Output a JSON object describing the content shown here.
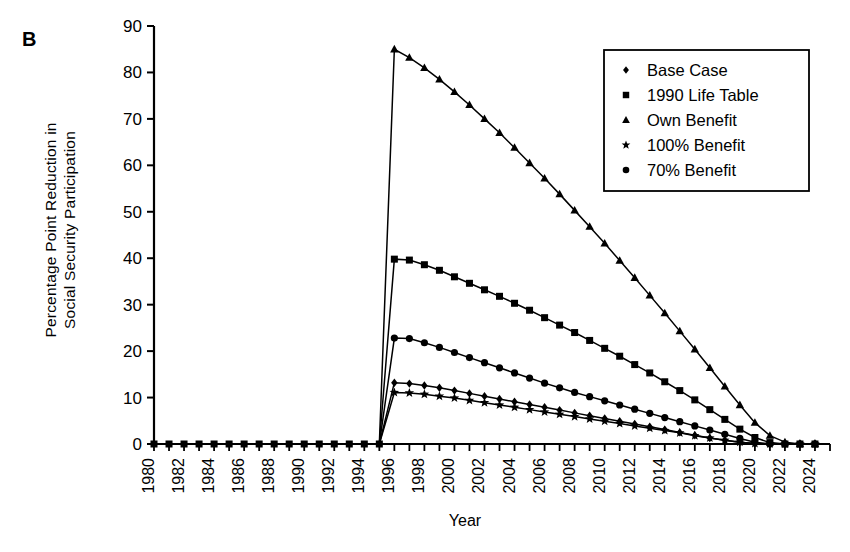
{
  "panel": {
    "label": "B"
  },
  "axes": {
    "ylabel_line1": "Percentage Point Reduction in",
    "ylabel_line2": "Social Security Participation",
    "xlabel": "Year",
    "y_ticks": [
      "0",
      "10",
      "20",
      "30",
      "40",
      "50",
      "60",
      "70",
      "80",
      "90"
    ],
    "x_ticks": [
      "1980",
      "1982",
      "1984",
      "1986",
      "1988",
      "1990",
      "1992",
      "1994",
      "1996",
      "1998",
      "2000",
      "2002",
      "2004",
      "2006",
      "2008",
      "2010",
      "2012",
      "2014",
      "2016",
      "2018",
      "2020",
      "2022",
      "2024"
    ]
  },
  "legend": {
    "items": [
      {
        "label": "Base Case",
        "marker": "diamond"
      },
      {
        "label": "1990 Life Table",
        "marker": "square"
      },
      {
        "label": "Own Benefit",
        "marker": "triangle"
      },
      {
        "label": "100% Benefit",
        "marker": "star"
      },
      {
        "label": "70% Benefit",
        "marker": "circle"
      }
    ]
  },
  "chart_data": {
    "type": "line",
    "title": "B",
    "xlabel": "Year",
    "ylabel": "Percentage Point Reduction in Social Security Participation",
    "xlim": [
      1980,
      2025
    ],
    "ylim": [
      0,
      90
    ],
    "grid": false,
    "legend_position": "top-right",
    "x": [
      1980,
      1981,
      1982,
      1983,
      1984,
      1985,
      1986,
      1987,
      1988,
      1989,
      1990,
      1991,
      1992,
      1993,
      1994,
      1995,
      1996,
      1997,
      1998,
      1999,
      2000,
      2001,
      2002,
      2003,
      2004,
      2005,
      2006,
      2007,
      2008,
      2009,
      2010,
      2011,
      2012,
      2013,
      2014,
      2015,
      2016,
      2017,
      2018,
      2019,
      2020,
      2021,
      2022,
      2023,
      2024
    ],
    "series": [
      {
        "name": "Base Case",
        "marker": "diamond",
        "values": [
          0,
          0,
          0,
          0,
          0,
          0,
          0,
          0,
          0,
          0,
          0,
          0,
          0,
          0,
          0,
          0,
          13.2,
          13.0,
          12.6,
          12.1,
          11.5,
          10.9,
          10.3,
          9.7,
          9.1,
          8.5,
          7.9,
          7.3,
          6.7,
          6.1,
          5.5,
          4.9,
          4.3,
          3.7,
          3.1,
          2.5,
          1.9,
          1.3,
          0.8,
          0.4,
          0.1,
          0,
          0,
          0,
          0
        ]
      },
      {
        "name": "1990 Life Table",
        "marker": "square",
        "values": [
          0,
          0,
          0,
          0,
          0,
          0,
          0,
          0,
          0,
          0,
          0,
          0,
          0,
          0,
          0,
          0,
          39.8,
          39.6,
          38.6,
          37.4,
          36.0,
          34.6,
          33.2,
          31.8,
          30.3,
          28.8,
          27.2,
          25.6,
          24.0,
          22.3,
          20.6,
          18.9,
          17.1,
          15.3,
          13.4,
          11.5,
          9.5,
          7.4,
          5.3,
          3.2,
          1.4,
          0.3,
          0,
          0,
          0
        ]
      },
      {
        "name": "Own Benefit",
        "marker": "triangle",
        "values": [
          0,
          0,
          0,
          0,
          0,
          0,
          0,
          0,
          0,
          0,
          0,
          0,
          0,
          0,
          0,
          0,
          85.0,
          83.2,
          81.0,
          78.5,
          75.8,
          73.0,
          70.0,
          67.0,
          63.8,
          60.5,
          57.2,
          53.8,
          50.3,
          46.8,
          43.2,
          39.5,
          35.8,
          32.0,
          28.2,
          24.3,
          20.4,
          16.4,
          12.4,
          8.4,
          4.6,
          1.8,
          0.4,
          0,
          0
        ]
      },
      {
        "name": "100% Benefit",
        "marker": "star",
        "values": [
          0,
          0,
          0,
          0,
          0,
          0,
          0,
          0,
          0,
          0,
          0,
          0,
          0,
          0,
          0,
          0,
          11.1,
          11.0,
          10.7,
          10.3,
          9.9,
          9.4,
          8.9,
          8.4,
          7.9,
          7.4,
          6.9,
          6.4,
          5.9,
          5.4,
          4.9,
          4.4,
          3.9,
          3.4,
          2.9,
          2.4,
          1.8,
          1.3,
          0.8,
          0.4,
          0.1,
          0,
          0,
          0,
          0
        ]
      },
      {
        "name": "70% Benefit",
        "marker": "circle",
        "values": [
          0,
          0,
          0,
          0,
          0,
          0,
          0,
          0,
          0,
          0,
          0,
          0,
          0,
          0,
          0,
          0,
          22.8,
          22.7,
          21.8,
          20.8,
          19.7,
          18.6,
          17.5,
          16.4,
          15.3,
          14.2,
          13.1,
          12.1,
          11.1,
          10.2,
          9.3,
          8.4,
          7.5,
          6.6,
          5.7,
          4.8,
          3.9,
          3.0,
          2.1,
          1.2,
          0.4,
          0,
          0,
          0,
          0
        ]
      }
    ]
  },
  "colors": {
    "line": "#000000",
    "axis": "#000000",
    "background": "#ffffff"
  }
}
